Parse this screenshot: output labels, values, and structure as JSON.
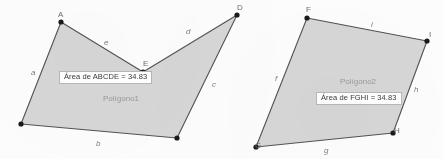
{
  "figure": {
    "background_color": "#fdfdfd",
    "polygon_fill": "#d6d6d6",
    "polygon_stroke": "#4a4a4a",
    "vertex_color": "#1a1a1a",
    "label_color": "#8a8a8a"
  },
  "polygon1": {
    "name": "Polígono1",
    "name_pos": {
      "x": 103,
      "y": 94
    },
    "area_label": "Área de  ABCDE = 34.83",
    "area_box_pos": {
      "x": 59,
      "y": 71
    },
    "fill": "#d6d6d6",
    "stroke": "#4a4a4a",
    "points": "61,22 143,72 237,15 177,138 21,124",
    "vertices": [
      {
        "id": "A",
        "label": "A",
        "x": 61,
        "y": 22,
        "label_x": 58,
        "label_y": 10
      },
      {
        "id": "E",
        "label": "E",
        "x": 143,
        "y": 72,
        "label_x": 143,
        "label_y": 59
      },
      {
        "id": "D",
        "label": "D",
        "x": 237,
        "y": 15,
        "label_x": 237,
        "label_y": 3
      },
      {
        "id": "C",
        "label": "",
        "x": 177,
        "y": 138,
        "label_x": 180,
        "label_y": 140
      },
      {
        "id": "B",
        "label": "",
        "x": 21,
        "y": 124,
        "label_x": 10,
        "label_y": 118
      }
    ],
    "edges": [
      {
        "id": "e",
        "label": "e",
        "x": 104,
        "y": 38
      },
      {
        "id": "d",
        "label": "d",
        "x": 186,
        "y": 27
      },
      {
        "id": "c",
        "label": "c",
        "x": 212,
        "y": 80
      },
      {
        "id": "b",
        "label": "b",
        "x": 96,
        "y": 139
      },
      {
        "id": "a",
        "label": "a",
        "x": 31,
        "y": 68
      }
    ]
  },
  "polygon2": {
    "name": "Polígono2",
    "name_pos": {
      "x": 340,
      "y": 77
    },
    "area_label": "Área de  FGHI = 34.83",
    "area_box_pos": {
      "x": 316,
      "y": 92
    },
    "fill": "#d6d6d6",
    "stroke": "#4a4a4a",
    "points": "307,18 427,41 393,133 256,147",
    "vertices": [
      {
        "id": "F",
        "label": "F",
        "x": 307,
        "y": 18,
        "label_x": 306,
        "label_y": 5
      },
      {
        "id": "I",
        "label": "I",
        "x": 427,
        "y": 41,
        "label_x": 429,
        "label_y": 30
      },
      {
        "id": "H",
        "label": "H",
        "x": 393,
        "y": 133,
        "label_x": 394,
        "label_y": 126
      },
      {
        "id": "G",
        "label": "G",
        "x": 256,
        "y": 147,
        "label_x": 255,
        "label_y": 141
      }
    ],
    "edges": [
      {
        "id": "i",
        "label": "i",
        "x": 371,
        "y": 20
      },
      {
        "id": "h",
        "label": "h",
        "x": 414,
        "y": 85
      },
      {
        "id": "g",
        "label": "g",
        "x": 324,
        "y": 146
      },
      {
        "id": "f",
        "label": "f",
        "x": 275,
        "y": 74
      }
    ]
  }
}
